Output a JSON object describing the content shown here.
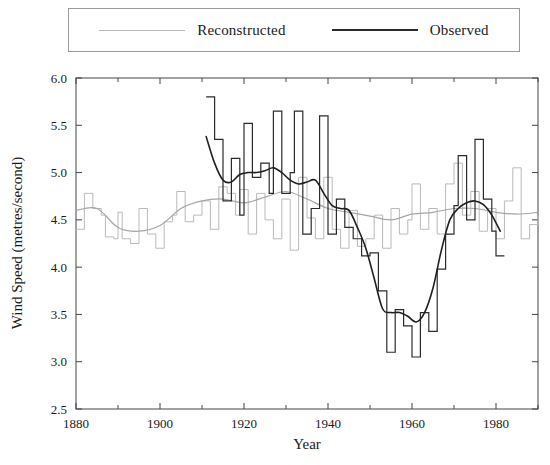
{
  "legend": {
    "position": "top",
    "entries": [
      {
        "label": "Reconstructed",
        "color": "#b9b9b9",
        "swatch": "line-swatch-reconstructed"
      },
      {
        "label": "Observed",
        "color": "#2b2b2b",
        "swatch": "line-swatch-observed"
      }
    ]
  },
  "chart_data": {
    "type": "line",
    "title": "",
    "subtitle": "",
    "xlabel": "Year",
    "ylabel": "Wind Speed (metres/second)",
    "xlim": [
      1880,
      1990
    ],
    "ylim": [
      2.5,
      6.0
    ],
    "grid": false,
    "x_major_ticks": [
      1880,
      1900,
      1920,
      1940,
      1960,
      1980
    ],
    "x_minor_ticks": [
      1890,
      1910,
      1930,
      1950,
      1970,
      1990
    ],
    "x_tick_labels": [
      "1880",
      "1900",
      "1920",
      "1940",
      "1960",
      "1980"
    ],
    "y_ticks": [
      2.5,
      3.0,
      3.5,
      4.0,
      4.5,
      5.0,
      5.5,
      6.0
    ],
    "y_tick_labels": [
      "2.5",
      "3.0",
      "3.5",
      "4.0",
      "4.5",
      "5.0",
      "5.5",
      "6.0"
    ],
    "series": [
      {
        "name": "Reconstructed",
        "color": "#b9b9b9",
        "style": "step",
        "x": [
          1880,
          1881,
          1882,
          1883,
          1884,
          1885,
          1886,
          1887,
          1888,
          1889,
          1890,
          1891,
          1892,
          1893,
          1894,
          1895,
          1896,
          1897,
          1898,
          1899,
          1900,
          1901,
          1902,
          1903,
          1904,
          1905,
          1906,
          1907,
          1908,
          1909,
          1910,
          1911,
          1912,
          1913,
          1914,
          1915,
          1916,
          1917,
          1918,
          1919,
          1920,
          1921,
          1922,
          1923,
          1924,
          1925,
          1926,
          1927,
          1928,
          1929,
          1930,
          1931,
          1932,
          1933,
          1934,
          1935,
          1936,
          1937,
          1938,
          1939,
          1940,
          1941,
          1942,
          1943,
          1944,
          1945,
          1946,
          1947,
          1948,
          1949,
          1950,
          1951,
          1952,
          1953,
          1954,
          1955,
          1956,
          1957,
          1958,
          1959,
          1960,
          1961,
          1962,
          1963,
          1964,
          1965,
          1966,
          1967,
          1968,
          1969,
          1970,
          1971,
          1972,
          1973,
          1974,
          1975,
          1976,
          1977,
          1978,
          1979,
          1980,
          1981,
          1982,
          1983,
          1984,
          1985,
          1986,
          1987,
          1988,
          1989,
          1990
        ],
        "y": [
          4.4,
          4.4,
          4.78,
          4.78,
          4.62,
          4.62,
          4.55,
          4.32,
          4.32,
          4.3,
          4.58,
          4.3,
          4.3,
          4.25,
          4.25,
          4.62,
          4.62,
          4.35,
          4.35,
          4.2,
          4.2,
          4.48,
          4.48,
          4.55,
          4.8,
          4.8,
          4.48,
          4.48,
          4.55,
          4.55,
          4.7,
          4.7,
          4.4,
          4.4,
          4.85,
          4.85,
          4.78,
          4.78,
          4.55,
          4.82,
          4.82,
          4.35,
          4.35,
          4.78,
          4.78,
          4.5,
          4.5,
          4.3,
          4.3,
          4.72,
          4.72,
          4.18,
          4.18,
          4.95,
          4.95,
          4.52,
          4.52,
          4.3,
          4.3,
          4.95,
          4.95,
          4.4,
          4.4,
          4.2,
          4.2,
          4.6,
          4.6,
          4.22,
          4.22,
          4.3,
          4.3,
          4.55,
          4.55,
          4.2,
          4.2,
          4.62,
          4.62,
          4.35,
          4.35,
          4.5,
          4.88,
          4.88,
          4.4,
          4.4,
          4.62,
          4.62,
          4.35,
          4.35,
          4.88,
          4.88,
          5.1,
          5.1,
          4.55,
          4.55,
          4.8,
          4.8,
          4.38,
          4.38,
          4.62,
          4.62,
          4.3,
          4.3,
          4.7,
          4.7,
          5.05,
          5.05,
          4.3,
          4.3,
          4.45,
          4.45,
          4.55
        ],
        "trend": {
          "name": "Reconstructed smoothed trend",
          "x": [
            1880,
            1885,
            1890,
            1895,
            1900,
            1905,
            1910,
            1915,
            1920,
            1925,
            1930,
            1935,
            1940,
            1945,
            1950,
            1955,
            1960,
            1965,
            1970,
            1975,
            1980,
            1985,
            1990
          ],
          "y": [
            4.6,
            4.62,
            4.42,
            4.38,
            4.44,
            4.62,
            4.7,
            4.72,
            4.68,
            4.74,
            4.8,
            4.72,
            4.62,
            4.58,
            4.54,
            4.5,
            4.56,
            4.58,
            4.62,
            4.62,
            4.58,
            4.56,
            4.58
          ]
        }
      },
      {
        "name": "Observed",
        "color": "#2b2b2b",
        "style": "step",
        "x": [
          1911,
          1912,
          1913,
          1914,
          1915,
          1916,
          1917,
          1918,
          1919,
          1920,
          1921,
          1922,
          1923,
          1924,
          1925,
          1926,
          1927,
          1928,
          1929,
          1930,
          1931,
          1932,
          1933,
          1934,
          1935,
          1936,
          1937,
          1938,
          1939,
          1940,
          1941,
          1942,
          1943,
          1944,
          1945,
          1946,
          1947,
          1948,
          1949,
          1950,
          1951,
          1952,
          1953,
          1954,
          1955,
          1956,
          1957,
          1958,
          1959,
          1960,
          1961,
          1962,
          1963,
          1964,
          1965,
          1966,
          1967,
          1968,
          1969,
          1970,
          1971,
          1972,
          1973,
          1974,
          1975,
          1976,
          1977,
          1978,
          1979,
          1980,
          1981
        ],
        "y": [
          5.8,
          5.8,
          5.35,
          5.35,
          4.7,
          4.7,
          5.15,
          5.15,
          4.55,
          5.52,
          5.52,
          4.95,
          4.95,
          5.1,
          5.1,
          4.78,
          5.65,
          5.65,
          4.78,
          4.78,
          5.0,
          5.65,
          5.65,
          4.35,
          4.35,
          4.62,
          4.62,
          5.6,
          5.6,
          4.35,
          4.35,
          4.72,
          4.72,
          4.42,
          4.42,
          4.3,
          4.3,
          4.12,
          4.12,
          4.15,
          4.15,
          3.75,
          3.75,
          3.1,
          3.1,
          3.55,
          3.55,
          3.38,
          3.38,
          3.05,
          3.05,
          3.52,
          3.52,
          3.32,
          3.32,
          3.98,
          3.98,
          4.35,
          4.35,
          4.65,
          5.18,
          5.18,
          4.5,
          4.5,
          5.35,
          5.35,
          4.72,
          4.72,
          4.38,
          4.12,
          4.12
        ],
        "trend": {
          "name": "Observed smoothed trend",
          "x": [
            1911,
            1913,
            1915,
            1917,
            1919,
            1921,
            1923,
            1925,
            1927,
            1929,
            1931,
            1933,
            1935,
            1937,
            1939,
            1941,
            1943,
            1945,
            1947,
            1949,
            1951,
            1953,
            1955,
            1957,
            1959,
            1961,
            1963,
            1965,
            1967,
            1969,
            1971,
            1973,
            1975,
            1977,
            1979,
            1981
          ],
          "y": [
            5.38,
            5.1,
            4.92,
            4.9,
            4.98,
            5.0,
            5.0,
            5.02,
            5.05,
            5.0,
            4.92,
            4.88,
            4.9,
            4.92,
            4.78,
            4.65,
            4.62,
            4.6,
            4.42,
            4.2,
            3.88,
            3.56,
            3.52,
            3.52,
            3.48,
            3.42,
            3.52,
            3.78,
            4.18,
            4.5,
            4.62,
            4.68,
            4.7,
            4.66,
            4.55,
            4.38
          ]
        }
      }
    ],
    "annotations": []
  },
  "axes": {
    "x_axis_name": "year-axis",
    "y_axis_name": "wind-speed-axis"
  }
}
